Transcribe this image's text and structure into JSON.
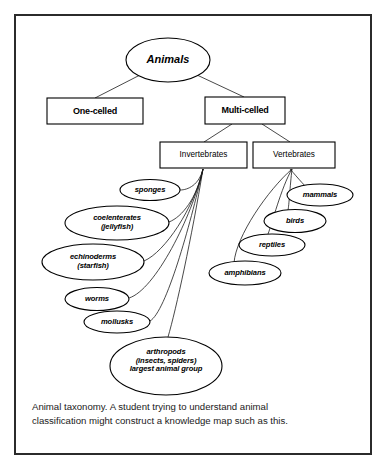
{
  "figure": {
    "caption_line1": "Animal taxonomy. A student trying to understand animal",
    "caption_line2": "classification might construct a knowledge map such as this.",
    "frame_color": "#2b2b2b",
    "ink_color": "#000000"
  },
  "diagram": {
    "root": {
      "label": "Animals",
      "shape": "ellipse",
      "cx": 168,
      "cy": 60,
      "rx": 42,
      "ry": 22
    },
    "level1": [
      {
        "label": "One-celled",
        "shape": "rect",
        "x": 47,
        "y": 98,
        "w": 96,
        "h": 26
      },
      {
        "label": "Multi-celled",
        "shape": "rect",
        "x": 205,
        "y": 97,
        "w": 80,
        "h": 27
      }
    ],
    "level2": [
      {
        "label": "Invertebrates",
        "shape": "rect",
        "x": 160,
        "y": 142,
        "w": 87,
        "h": 26
      },
      {
        "label": "Vertebrates",
        "shape": "rect",
        "x": 253,
        "y": 142,
        "w": 82,
        "h": 26
      }
    ],
    "invertebrates": [
      {
        "label": "sponges",
        "cx": 150,
        "cy": 190,
        "rx": 30,
        "ry": 10.5
      },
      {
        "label": "coelenterates\n(jellyfish)",
        "cx": 117,
        "cy": 223,
        "rx": 52,
        "ry": 17
      },
      {
        "label": "echinoderms\n(starfish)",
        "cx": 93,
        "cy": 262,
        "rx": 51,
        "ry": 18
      },
      {
        "label": "worms",
        "cx": 97,
        "cy": 299,
        "rx": 32,
        "ry": 11.5
      },
      {
        "label": "mollusks",
        "cx": 117,
        "cy": 322,
        "rx": 33,
        "ry": 11
      },
      {
        "label": "arthropods\n(insects, spiders)\nlargest animal group",
        "cx": 166,
        "cy": 366,
        "rx": 56,
        "ry": 29
      }
    ],
    "vertebrates": [
      {
        "label": "mammals",
        "cx": 320,
        "cy": 195,
        "rx": 33,
        "ry": 11
      },
      {
        "label": "birds",
        "cx": 295,
        "cy": 221,
        "rx": 31,
        "ry": 11.5
      },
      {
        "label": "reptiles",
        "cx": 272,
        "cy": 245,
        "rx": 33,
        "ry": 11
      },
      {
        "label": "amphibians",
        "cx": 245,
        "cy": 273,
        "rx": 36,
        "ry": 12
      }
    ],
    "invertebrate_fan_origin": {
      "x": 203,
      "y": 170
    },
    "vertebrate_fan_origin": {
      "x": 290,
      "y": 170
    }
  }
}
